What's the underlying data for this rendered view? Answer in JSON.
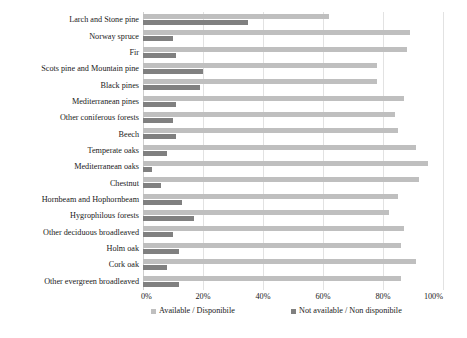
{
  "chart_data": {
    "type": "bar",
    "orientation": "horizontal",
    "stacked": false,
    "grouped": true,
    "title": "",
    "subtitle": "",
    "xlabel": "",
    "ylabel": "",
    "xlim": [
      0,
      100
    ],
    "xtick_labels": [
      "0%",
      "20%",
      "40%",
      "60%",
      "80%",
      "100%"
    ],
    "xticks": [
      0,
      20,
      40,
      60,
      80,
      100
    ],
    "grid": true,
    "grid_axis": "x",
    "legend_position": "bottom",
    "categories": [
      "Larch and Stone pine",
      "Norway spruce",
      "Fir",
      "Scots pine and Mountain pine",
      "Black pines",
      "Mediterranean pines",
      "Other coniferous forests",
      "Beech",
      "Temperate oaks",
      "Mediterranean oaks",
      "Chestnut",
      "Hornbeam and Hophornbeam",
      "Hygrophilous forests",
      "Other deciduous broadleaved",
      "Holm oak",
      "Cork oak",
      "Other evergreen broadleaved"
    ],
    "series": [
      {
        "name": "Available / Disponibile",
        "color": "#bfbfbf",
        "values": [
          62,
          89,
          88,
          78,
          78,
          87,
          84,
          85,
          91,
          95,
          92,
          85,
          82,
          87,
          86,
          91,
          86
        ]
      },
      {
        "name": "Not available / Non disponibile",
        "color": "#808080",
        "values": [
          35,
          10,
          11,
          20,
          19,
          11,
          10,
          11,
          8,
          3,
          6,
          13,
          17,
          10,
          12,
          8,
          12
        ]
      }
    ]
  },
  "legend": {
    "items": [
      {
        "label": "Available / Disponibile",
        "color": "#bfbfbf"
      },
      {
        "label": "Not available / Non disponibile",
        "color": "#808080"
      }
    ]
  }
}
